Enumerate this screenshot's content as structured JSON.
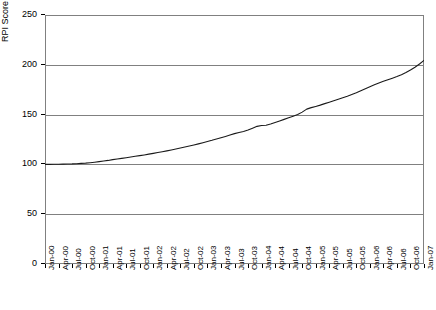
{
  "chart_data": {
    "type": "line",
    "title": "",
    "subtitle": "",
    "xlabel": "",
    "ylabel": "RPI Score",
    "ylim": [
      0,
      250
    ],
    "yticks": [
      0,
      50,
      100,
      150,
      200,
      250
    ],
    "grid": true,
    "legend": false,
    "legend_position": "none",
    "line_color": "#1a1a1a",
    "axis_color": "#808080",
    "tick_label_rotation": -90,
    "x_tick_labels": [
      "Jan-00",
      "Apr-00",
      "Jul-00",
      "Oct-00",
      "Jan-01",
      "Apr-01",
      "Jul-01",
      "Oct-01",
      "Jan-02",
      "Apr-02",
      "Jul-02",
      "Oct-02",
      "Jan-03",
      "Apr-03",
      "Jul-03",
      "Oct-03",
      "Jan-04",
      "Apr-04",
      "Jul-04",
      "Oct-04",
      "Jan-05",
      "Apr-05",
      "Jul-05",
      "Oct-05",
      "Jan-06",
      "Apr-06",
      "Jul-06",
      "Oct-06",
      "Jan-07"
    ],
    "x_tick_interval_months": 3,
    "x_start": "Jan-00",
    "x_end": "Jan-07",
    "series": [
      {
        "name": "RPI Score",
        "x": [
          "Jan-00",
          "Feb-00",
          "Mar-00",
          "Apr-00",
          "May-00",
          "Jun-00",
          "Jul-00",
          "Aug-00",
          "Sep-00",
          "Oct-00",
          "Nov-00",
          "Dec-00",
          "Jan-01",
          "Feb-01",
          "Mar-01",
          "Apr-01",
          "May-01",
          "Jun-01",
          "Jul-01",
          "Aug-01",
          "Sep-01",
          "Oct-01",
          "Nov-01",
          "Dec-01",
          "Jan-02",
          "Feb-02",
          "Mar-02",
          "Apr-02",
          "May-02",
          "Jun-02",
          "Jul-02",
          "Aug-02",
          "Sep-02",
          "Oct-02",
          "Nov-02",
          "Dec-02",
          "Jan-03",
          "Feb-03",
          "Mar-03",
          "Apr-03",
          "May-03",
          "Jun-03",
          "Jul-03",
          "Aug-03",
          "Sep-03",
          "Oct-03",
          "Nov-03",
          "Dec-03",
          "Jan-04",
          "Feb-04",
          "Mar-04",
          "Apr-04",
          "May-04",
          "Jun-04",
          "Jul-04",
          "Aug-04",
          "Sep-04",
          "Oct-04",
          "Nov-04",
          "Dec-04",
          "Jan-05",
          "Feb-05",
          "Mar-05",
          "Apr-05",
          "May-05",
          "Jun-05",
          "Jul-05",
          "Aug-05",
          "Sep-05",
          "Oct-05",
          "Nov-05",
          "Dec-05",
          "Jan-06",
          "Feb-06",
          "Mar-06",
          "Apr-06",
          "May-06",
          "Jun-06",
          "Jul-06",
          "Aug-06",
          "Sep-06",
          "Oct-06",
          "Nov-06",
          "Dec-06",
          "Jan-07"
        ],
        "values": [
          100.0,
          100.0,
          100.1,
          100.2,
          100.3,
          100.4,
          100.5,
          100.7,
          101.0,
          101.3,
          101.7,
          102.2,
          102.8,
          103.4,
          104.0,
          104.8,
          105.4,
          106.0,
          106.7,
          107.4,
          108.1,
          108.8,
          109.5,
          110.3,
          111.1,
          111.9,
          112.7,
          113.6,
          114.5,
          115.4,
          116.4,
          117.4,
          118.4,
          119.5,
          120.6,
          121.8,
          123.0,
          124.2,
          125.5,
          126.8,
          128.1,
          129.5,
          130.9,
          132.0,
          133.0,
          134.5,
          136.3,
          138.2,
          139.0,
          139.3,
          140.5,
          142.0,
          143.6,
          145.2,
          146.8,
          148.4,
          150.0,
          152.5,
          155.5,
          157.0,
          158.2,
          159.5,
          161.0,
          162.5,
          164.0,
          165.5,
          167.0,
          168.5,
          170.2,
          172.0,
          174.0,
          176.0,
          178.0,
          180.0,
          181.8,
          183.4,
          185.0,
          186.6,
          188.2,
          190.0,
          192.2,
          194.8,
          197.6,
          200.8,
          204.5
        ]
      }
    ]
  }
}
